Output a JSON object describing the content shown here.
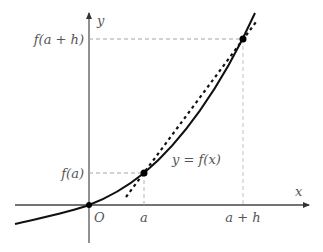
{
  "diagram": {
    "axes": {
      "x_label": "x",
      "y_label": "y",
      "origin_label": "O"
    },
    "curve_label": "y = f(x)",
    "x_ticks": [
      "a",
      "a + h"
    ],
    "y_ticks": [
      "f(a)",
      "f(a + h)"
    ],
    "points": [
      {
        "name": "P",
        "x_label": "a",
        "y_label": "f(a)"
      },
      {
        "name": "Q",
        "x_label": "a + h",
        "y_label": "f(a + h)"
      }
    ],
    "colors": {
      "axis": "#444444",
      "curve": "#111111",
      "secant": "#111111",
      "guide": "#999999",
      "label": "#555555"
    }
  }
}
